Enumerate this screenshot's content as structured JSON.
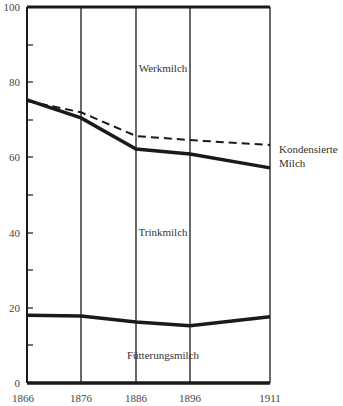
{
  "chart_data": {
    "type": "line",
    "title": "",
    "xlabel": "",
    "ylabel": "",
    "x": [
      1866,
      1876,
      1886,
      1896,
      1911
    ],
    "ylim": [
      0,
      100
    ],
    "yticks": [
      0,
      20,
      40,
      60,
      80,
      100
    ],
    "yminor_ticks": [
      10,
      30,
      50,
      70,
      90
    ],
    "grid": "vertical lines at each x value",
    "series": [
      {
        "name": "Trinkmilch / Werkmilch boundary",
        "style": "solid",
        "values": [
          75.3,
          70.5,
          62.2,
          60.9,
          57.2
        ]
      },
      {
        "name": "Kondensierte Milch",
        "style": "dashed",
        "values": [
          75.0,
          72.0,
          65.7,
          64.6,
          63.3
        ]
      },
      {
        "name": "Fütterungsmilch / Trinkmilch boundary",
        "style": "solid",
        "values": [
          18.0,
          17.8,
          16.2,
          15.2,
          17.6
        ]
      }
    ],
    "area_labels": [
      "Werkmilch",
      "Trinkmilch",
      "Fütterungsmilch"
    ],
    "annotations": [
      "Kondensierte",
      "Milch"
    ]
  },
  "labels": {
    "werkmilch": "Werkmilch",
    "trinkmilch": "Trinkmilch",
    "fuetterungsmilch": "Fütterungsmilch",
    "kondensierte_1": "Kondensierte",
    "kondensierte_2": "Milch"
  },
  "yaxis": {
    "t0": "0",
    "t20": "20",
    "t40": "40",
    "t60": "60",
    "t80": "80",
    "t100": "100"
  },
  "xaxis": {
    "x0": "1866",
    "x1": "1876",
    "x2": "1886",
    "x3": "1896",
    "x4": "1911"
  }
}
